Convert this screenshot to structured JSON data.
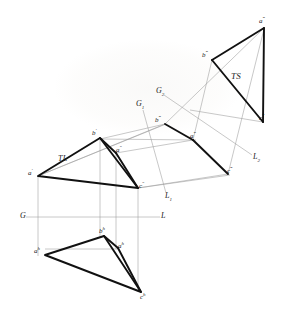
{
  "figure": {
    "kind": "descriptive-geometry-projection",
    "stroke_color_heavy": "#111111",
    "stroke_color_light": "#9a9a9a",
    "background": "#ffffff"
  },
  "fold_lines": [
    {
      "id": "gl",
      "left_label": "G",
      "right_label": "L",
      "left_x": 22,
      "left_y": 217,
      "right_x": 163,
      "right_y": 217
    },
    {
      "id": "g1l1",
      "left_label": "G₁",
      "right_label": "L₁",
      "left_x": 140,
      "left_y": 105,
      "right_x": 168,
      "right_y": 197
    },
    {
      "id": "g2l2",
      "left_label": "G₂",
      "right_label": "L₂",
      "left_x": 160,
      "left_y": 92,
      "right_x": 256,
      "right_y": 158
    }
  ],
  "annotations": [
    {
      "name": "true-length-annotation",
      "text": "TL",
      "x": 61,
      "y": 159
    },
    {
      "name": "true-shape-annotation",
      "text": "TS",
      "x": 235,
      "y": 77
    }
  ],
  "views": [
    {
      "name": "frontal-view",
      "vertices": [
        {
          "id": "a-front",
          "label": "a",
          "prime": "′",
          "x": 38,
          "y": 176,
          "label_x": 30,
          "label_y": 172
        },
        {
          "id": "b-front",
          "label": "b",
          "prime": "′",
          "x": 100,
          "y": 138,
          "label_x": 94,
          "label_y": 131
        },
        {
          "id": "c-front",
          "label": "c",
          "prime": "″",
          "x": 138,
          "y": 188,
          "label_x": 140,
          "label_y": 185
        },
        {
          "id": "a-aux0",
          "label": "a",
          "prime": "″",
          "x": 116,
          "y": 153,
          "label_x": 117,
          "label_y": 150
        }
      ]
    },
    {
      "name": "horizontal-view",
      "vertices": [
        {
          "id": "a-horiz",
          "label": "a",
          "prime": "h",
          "x": 45,
          "y": 255,
          "label_x": 36,
          "label_y": 250
        },
        {
          "id": "b-horiz",
          "label": "b",
          "prime": "h",
          "x": 104,
          "y": 236,
          "label_x": 100,
          "label_y": 230
        },
        {
          "id": "c-horiz",
          "label": "c",
          "prime": "h",
          "x": 141,
          "y": 292,
          "label_x": 141,
          "label_y": 294
        },
        {
          "id": "a-horiz2",
          "label": "a",
          "prime": "h",
          "x": 118,
          "y": 248,
          "label_x": 119,
          "label_y": 245
        }
      ]
    },
    {
      "name": "first-auxiliary-view",
      "vertices": [
        {
          "id": "b-aux1",
          "label": "b",
          "prime": "‴",
          "x": 165,
          "y": 124,
          "label_x": 158,
          "label_y": 120
        },
        {
          "id": "a-aux1",
          "label": "a",
          "prime": "‴",
          "x": 193,
          "y": 140,
          "label_x": 192,
          "label_y": 137
        },
        {
          "id": "c-aux1",
          "label": "c",
          "prime": "‴",
          "x": 228,
          "y": 174,
          "label_x": 229,
          "label_y": 172
        }
      ]
    },
    {
      "name": "second-auxiliary-view",
      "vertices": [
        {
          "id": "a-aux2",
          "label": "a",
          "prime": "‴",
          "x": 264,
          "y": 28,
          "label_x": 262,
          "label_y": 22
        },
        {
          "id": "b-aux2",
          "label": "b",
          "prime": "‴",
          "x": 212,
          "y": 60,
          "label_x": 205,
          "label_y": 55
        },
        {
          "id": "c-aux2",
          "label": "c",
          "prime": "‴",
          "x": 263,
          "y": 122,
          "label_x": 262,
          "label_y": 120
        }
      ]
    }
  ]
}
